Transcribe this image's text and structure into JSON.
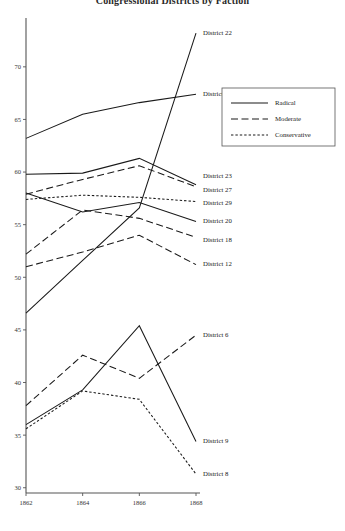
{
  "chart_data": {
    "type": "line",
    "title": "Congressional Districts by Faction",
    "xlabel": "",
    "ylabel": "",
    "x": [
      1862,
      1864,
      1866,
      1868
    ],
    "xtick_labels": [
      "1862",
      "1864",
      "1866",
      "1868"
    ],
    "ytick_labels": [
      "30",
      "35",
      "40",
      "45",
      "50",
      "55",
      "60",
      "65",
      "70"
    ],
    "yticks": [
      30,
      35,
      40,
      45,
      50,
      55,
      60,
      65,
      70
    ],
    "xlim": [
      1862,
      1868
    ],
    "ylim": [
      29.5,
      73.5
    ],
    "grid": false,
    "legend_position": "upper right",
    "legend": [
      {
        "name": "Radical",
        "style": "solid"
      },
      {
        "name": "Moderate",
        "style": "dashed"
      },
      {
        "name": "Conservative",
        "style": "dotted"
      }
    ],
    "series": [
      {
        "name": "District 22",
        "faction": "Radical",
        "style": "solid",
        "values": [
          46.6,
          51.6,
          56.6,
          73.2
        ],
        "label": "District 22",
        "label_y": 73.2
      },
      {
        "name": "District 31",
        "faction": "Radical",
        "style": "solid",
        "values": [
          63.2,
          65.5,
          66.6,
          67.4
        ],
        "label": "District 31",
        "label_y": 67.4
      },
      {
        "name": "District 23",
        "faction": "Radical",
        "style": "solid",
        "values": [
          59.8,
          59.9,
          61.3,
          58.8
        ],
        "label": "District 23",
        "label_y": 59.6
      },
      {
        "name": "District 27",
        "faction": "Moderate",
        "style": "dashed",
        "values": [
          57.9,
          59.3,
          60.6,
          58.6
        ],
        "label": "District 27",
        "label_y": 58.3
      },
      {
        "name": "District 29",
        "faction": "Conservative",
        "style": "dotted",
        "values": [
          57.4,
          57.8,
          57.6,
          57.2
        ],
        "label": "District 29",
        "label_y": 57.0
      },
      {
        "name": "District 20",
        "faction": "Radical",
        "style": "solid",
        "values": [
          58.0,
          56.2,
          57.1,
          55.3
        ],
        "label": "District 20",
        "label_y": 55.3
      },
      {
        "name": "District 18",
        "faction": "Moderate",
        "style": "dashed",
        "values": [
          52.2,
          56.4,
          55.6,
          53.8
        ],
        "label": "District 18",
        "label_y": 53.5
      },
      {
        "name": "District 12",
        "faction": "Moderate",
        "style": "dashed",
        "values": [
          51.0,
          52.4,
          54.0,
          51.2
        ],
        "label": "District 12",
        "label_y": 51.2
      },
      {
        "name": "District 6",
        "faction": "Moderate",
        "style": "dashed",
        "values": [
          37.8,
          42.6,
          40.4,
          44.5
        ],
        "label": "District 6",
        "label_y": 44.5
      },
      {
        "name": "District 9",
        "faction": "Radical",
        "style": "solid",
        "values": [
          36.0,
          39.3,
          45.4,
          34.4
        ],
        "label": "District 9",
        "label_y": 34.4
      },
      {
        "name": "District 8",
        "faction": "Conservative",
        "style": "dotted",
        "values": [
          35.6,
          39.2,
          38.4,
          31.3
        ],
        "label": "District 8",
        "label_y": 31.3
      }
    ]
  }
}
